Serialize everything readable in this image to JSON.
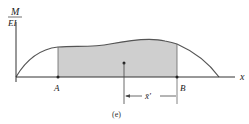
{
  "figure": {
    "caption": "(e)",
    "y_axis_label_top": "M",
    "y_axis_label_bottom": "EI",
    "x_axis_label": "x",
    "point_a_label": "A",
    "point_b_label": "B",
    "centroid_distance_label": "x̄′",
    "colors": {
      "shaded_area": "#cfcfcf",
      "lines": "#333333",
      "curve": "#555555"
    }
  }
}
